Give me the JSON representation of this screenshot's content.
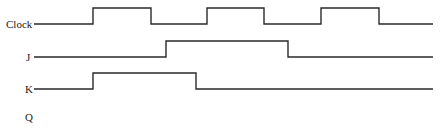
{
  "diagram": {
    "type": "timing-diagram",
    "stroke_color": "#2a2a2a",
    "signals": [
      {
        "name": "Clock",
        "label": "Clock",
        "label_x": 6,
        "label_y": 19,
        "points": "34,24 93,24 93,8 151,8 151,24 207,24 207,8 264,8 264,24 321,24 321,8 379,8 379,24 433,24"
      },
      {
        "name": "J",
        "label": "J",
        "label_x": 26,
        "label_y": 52,
        "points": "34,57 166,57 166,41 288,41 288,57 433,57"
      },
      {
        "name": "K",
        "label": "K",
        "label_x": 25,
        "label_y": 84,
        "points": "34,89 93,89 93,73 196,73 196,89 433,89"
      },
      {
        "name": "Q",
        "label": "Q",
        "label_x": 25,
        "label_y": 112,
        "points": ""
      }
    ]
  }
}
